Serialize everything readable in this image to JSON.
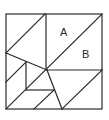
{
  "diagram": {
    "type": "geometric-dissection",
    "labels": [
      {
        "text": "A",
        "x": 60,
        "y": 36
      },
      {
        "text": "B",
        "x": 82,
        "y": 58
      }
    ],
    "outer_square": {
      "x1": 6,
      "y1": 14,
      "x2": 102,
      "y2": 109
    },
    "segments": [
      {
        "x1": 46,
        "y1": 14,
        "x2": 46,
        "y2": 70
      },
      {
        "x1": 102,
        "y1": 14,
        "x2": 6,
        "y2": 109
      },
      {
        "x1": 45,
        "y1": 14,
        "x2": 6,
        "y2": 53
      },
      {
        "x1": 6,
        "y1": 53,
        "x2": 47,
        "y2": 70
      },
      {
        "x1": 47,
        "y1": 70,
        "x2": 102,
        "y2": 70
      },
      {
        "x1": 102,
        "y1": 70,
        "x2": 62,
        "y2": 109
      },
      {
        "x1": 47,
        "y1": 70,
        "x2": 62,
        "y2": 109
      },
      {
        "x1": 26,
        "y1": 62,
        "x2": 26,
        "y2": 90
      },
      {
        "x1": 26,
        "y1": 90,
        "x2": 54,
        "y2": 90
      },
      {
        "x1": 6,
        "y1": 82,
        "x2": 26,
        "y2": 62
      },
      {
        "x1": 54,
        "y1": 90,
        "x2": 34,
        "y2": 109
      }
    ],
    "stroke_color": "#2a2a2a",
    "background": "#ffffff"
  }
}
